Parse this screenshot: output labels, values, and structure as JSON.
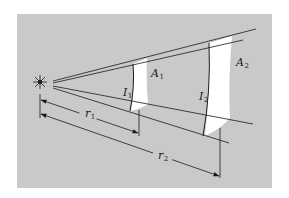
{
  "figure": {
    "background_color": "#c9c9c9",
    "surface_color": "#ffffff",
    "line_color": "#1a1a1a"
  },
  "source": {
    "label": "",
    "icon": "point-light-source"
  },
  "surfaces": [
    {
      "area_label": "A",
      "area_sub": "1",
      "intensity_label": "I",
      "intensity_sub": "1"
    },
    {
      "area_label": "A",
      "area_sub": "2",
      "intensity_label": "I",
      "intensity_sub": "2"
    }
  ],
  "dimensions": [
    {
      "label": "r",
      "sub": "1"
    },
    {
      "label": "r",
      "sub": "2"
    }
  ]
}
